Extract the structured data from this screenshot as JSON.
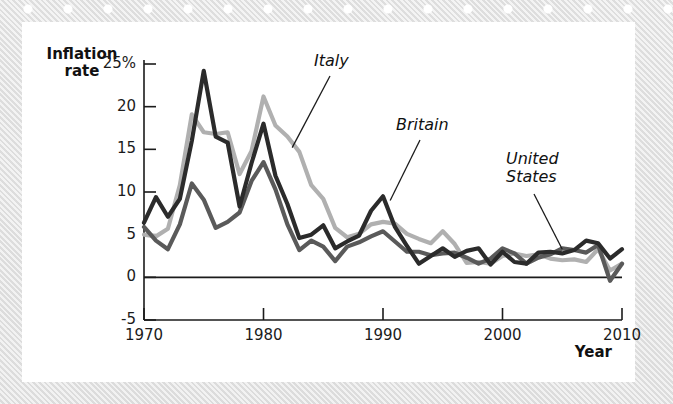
{
  "figure": {
    "y_axis_title_line1": "Inflation",
    "y_axis_title_line2": "rate",
    "x_axis_title": "Year"
  },
  "labels": {
    "italy": "Italy",
    "britain": "Britain",
    "united_states_line1": "United",
    "united_states_line2": "States"
  },
  "colors": {
    "britain": "#2b2b2b",
    "united_states": "#5a5a5a",
    "italy": "#b0b0b0",
    "axis": "#1b1b1b",
    "panel": "#ffffff",
    "border": "#e4e4e4"
  },
  "chart_data": {
    "type": "line",
    "title": "",
    "xlabel": "Year",
    "ylabel": "Inflation rate",
    "xlim": [
      1970,
      2010
    ],
    "ylim": [
      -5,
      25
    ],
    "yticks": [
      -5,
      0,
      5,
      10,
      15,
      20,
      25
    ],
    "ytick_labels": [
      "-5",
      "0",
      "5",
      "10",
      "15",
      "20",
      "25%"
    ],
    "xticks": [
      1970,
      1980,
      1990,
      2000,
      2010
    ],
    "xtick_labels": [
      "1970",
      "1980",
      "1990",
      "2000",
      "2010"
    ],
    "grid": false,
    "legend": "annotated-inline",
    "x": [
      1970,
      1971,
      1972,
      1973,
      1974,
      1975,
      1976,
      1977,
      1978,
      1979,
      1980,
      1981,
      1982,
      1983,
      1984,
      1985,
      1986,
      1987,
      1988,
      1989,
      1990,
      1991,
      1992,
      1993,
      1994,
      1995,
      1996,
      1997,
      1998,
      1999,
      2000,
      2001,
      2002,
      2003,
      2004,
      2005,
      2006,
      2007,
      2008,
      2009,
      2010
    ],
    "series": [
      {
        "name": "Britain",
        "color": "#2b2b2b",
        "values": [
          6.4,
          9.4,
          7.1,
          9.2,
          16.0,
          24.2,
          16.5,
          15.8,
          8.3,
          13.4,
          18.0,
          11.9,
          8.6,
          4.6,
          5.0,
          6.1,
          3.4,
          4.2,
          4.9,
          7.8,
          9.5,
          5.9,
          3.7,
          1.6,
          2.5,
          3.4,
          2.4,
          3.1,
          3.4,
          1.5,
          3.0,
          1.8,
          1.6,
          2.9,
          3.0,
          2.8,
          3.2,
          4.3,
          4.0,
          2.2,
          3.3
        ]
      },
      {
        "name": "United States",
        "color": "#5a5a5a",
        "values": [
          5.9,
          4.3,
          3.3,
          6.2,
          11.0,
          9.1,
          5.8,
          6.5,
          7.6,
          11.3,
          13.5,
          10.3,
          6.2,
          3.2,
          4.3,
          3.6,
          1.9,
          3.6,
          4.1,
          4.8,
          5.4,
          4.2,
          3.0,
          3.0,
          2.6,
          2.8,
          2.9,
          2.3,
          1.6,
          2.2,
          3.4,
          2.8,
          1.6,
          2.3,
          2.7,
          3.4,
          3.2,
          2.9,
          3.8,
          -0.4,
          1.6
        ]
      },
      {
        "name": "Italy",
        "color": "#b0b0b0",
        "values": [
          5.0,
          4.8,
          5.7,
          10.8,
          19.1,
          17.0,
          16.8,
          17.0,
          12.1,
          14.8,
          21.2,
          17.8,
          16.5,
          14.7,
          10.8,
          9.2,
          5.8,
          4.7,
          5.1,
          6.2,
          6.5,
          6.3,
          5.1,
          4.5,
          4.0,
          5.4,
          3.9,
          1.7,
          1.8,
          1.6,
          2.5,
          2.8,
          2.5,
          2.7,
          2.2,
          2.0,
          2.1,
          1.8,
          3.3,
          0.8,
          1.6
        ]
      }
    ],
    "annotations": [
      {
        "text": "Italy",
        "at_x": 1982,
        "at_y": 16.5
      },
      {
        "text": "Britain",
        "at_x": 1991,
        "at_y": 7.8
      },
      {
        "text": "United States",
        "at_x": 2005,
        "at_y": 3.2
      }
    ]
  }
}
